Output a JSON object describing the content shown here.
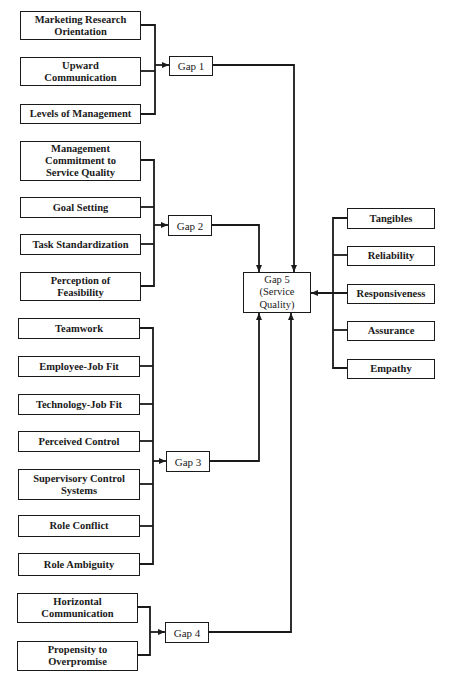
{
  "diagram": {
    "groups": [
      {
        "gap_label": "Gap 1",
        "factors": [
          "Marketing Research\nOrientation",
          "Upward\nCommunication",
          "Levels of Management"
        ]
      },
      {
        "gap_label": "Gap 2",
        "factors": [
          "Management\nCommitment to\nService Quality",
          "Goal Setting",
          "Task Standardization",
          "Perception of\nFeasibility"
        ]
      },
      {
        "gap_label": "Gap 3",
        "factors": [
          "Teamwork",
          "Employee-Job Fit",
          "Technology-Job Fit",
          "Perceived Control",
          "Supervisory Control\nSystems",
          "Role Conflict",
          "Role Ambiguity"
        ]
      },
      {
        "gap_label": "Gap 4",
        "factors": [
          "Horizontal\nCommunication",
          "Propensity to\nOverpromise"
        ]
      }
    ],
    "gap5": {
      "label": "Gap 5\n(Service\nQuality)"
    },
    "dimensions": [
      "Tangibles",
      "Reliability",
      "Responsiveness",
      "Assurance",
      "Empathy"
    ],
    "colors": {
      "line": "#1a1a1a",
      "box_fill": "#ffffff",
      "background": "#ffffff"
    }
  }
}
